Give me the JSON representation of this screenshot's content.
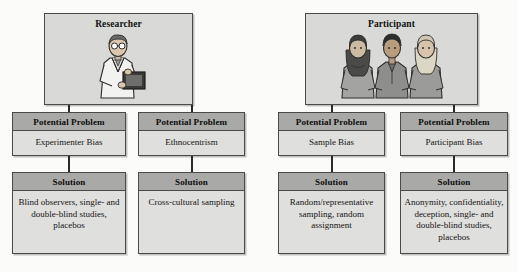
{
  "diagram": {
    "colors": {
      "header_fill": "#a9a9a7",
      "body_fill": "#dfdfdd",
      "top_fill": "#d9d9d7",
      "border": "#4a4a4a",
      "text": "#141414",
      "page_background": "#fbfbfa"
    },
    "branches": [
      {
        "source": {
          "label": "Researcher",
          "illustration": "researcher-with-clipboard-icon"
        },
        "columns": [
          {
            "problem_header": "Potential Problem",
            "problem_text": "Experimenter Bias",
            "solution_header": "Solution",
            "solution_text": "Blind observers, single- and double-blind studies, placebos"
          },
          {
            "problem_header": "Potential Problem",
            "problem_text": "Ethnocentrism",
            "solution_header": "Solution",
            "solution_text": "Cross-cultural sampling"
          }
        ]
      },
      {
        "source": {
          "label": "Participant",
          "illustration": "three-participants-icon"
        },
        "columns": [
          {
            "problem_header": "Potential Problem",
            "problem_text": "Sample Bias",
            "solution_header": "Solution",
            "solution_text": "Random/representative sampling, random assignment"
          },
          {
            "problem_header": "Potential Problem",
            "problem_text": "Participant Bias",
            "solution_header": "Solution",
            "solution_text": "Anonymity, confidentiality, deception, single- and double-blind studies, placebos"
          }
        ]
      }
    ]
  }
}
